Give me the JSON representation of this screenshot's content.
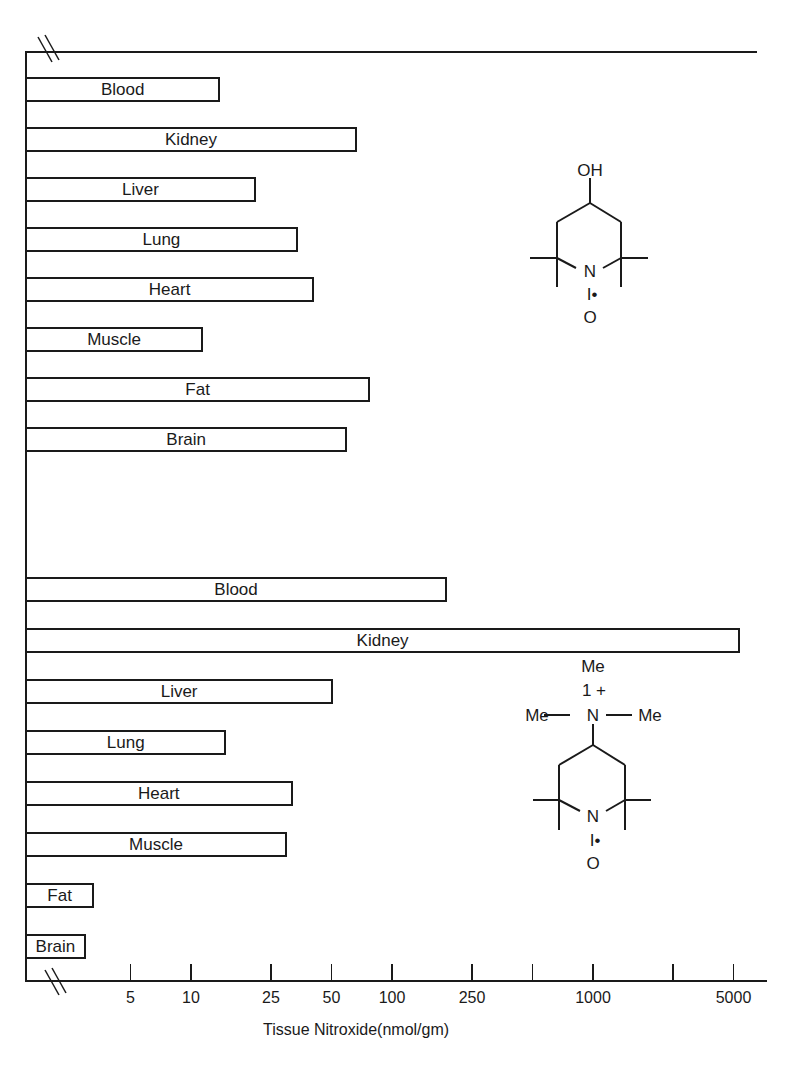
{
  "chart_data": {
    "type": "bar",
    "orientation": "horizontal",
    "x_scale": "log",
    "xlabel": "Tissue Nitroxide(nmol/gm)",
    "ylabel": "",
    "title": "",
    "x_ticks": [
      {
        "value": 5,
        "label": "5"
      },
      {
        "value": 10,
        "label": "10"
      },
      {
        "value": 25,
        "label": "25"
      },
      {
        "value": 50,
        "label": "50"
      },
      {
        "value": 100,
        "label": "100"
      },
      {
        "value": 250,
        "label": "250"
      },
      {
        "value": 500,
        "label": ""
      },
      {
        "value": 1000,
        "label": "1000"
      },
      {
        "value": 2500,
        "label": ""
      },
      {
        "value": 5000,
        "label": "5000"
      }
    ],
    "xlim": [
      2,
      7000
    ],
    "axis_break": true,
    "grid": false,
    "legend": null,
    "groups": [
      {
        "name": "4-hydroxy-TEMPO (OH nitroxide)",
        "structure": {
          "top_label": "OH",
          "n_label": "N",
          "radical_label": "I•",
          "o_label": "O"
        },
        "categories": [
          "Blood",
          "Kidney",
          "Liver",
          "Lung",
          "Heart",
          "Muscle",
          "Fat",
          "Brain"
        ],
        "values": [
          14,
          67,
          21,
          34,
          41,
          11.5,
          78,
          60
        ]
      },
      {
        "name": "4-trimethylammonium-TEMPO (cationic nitroxide)",
        "structure": {
          "me_top": "Me",
          "charge": "1 +",
          "me_left": "Me",
          "me_right": "Me",
          "amine_n": "N",
          "n_label": "N",
          "radical_label": "I•",
          "o_label": "O"
        },
        "categories": [
          "Blood",
          "Kidney",
          "Liver",
          "Lung",
          "Heart",
          "Muscle",
          "Fat",
          "Brain"
        ],
        "values": [
          188,
          5400,
          51,
          15,
          32,
          30,
          3.3,
          3.0
        ]
      }
    ]
  },
  "layout": {
    "bar_color": "#ffffff",
    "line_color": "#1a1a1a"
  }
}
